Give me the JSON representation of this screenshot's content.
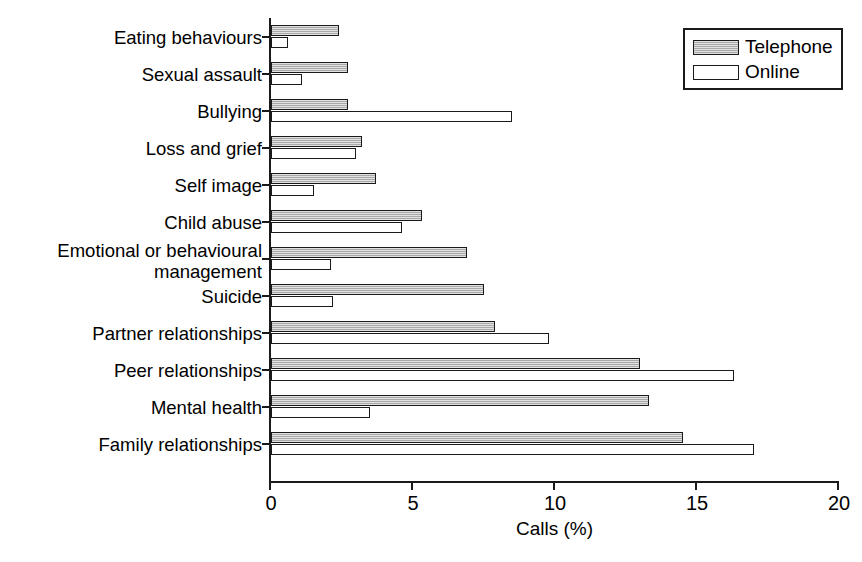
{
  "chart_data": {
    "type": "bar",
    "orientation": "horizontal",
    "title": "",
    "xlabel": "Calls (%)",
    "ylabel": "",
    "xlim": [
      0,
      20
    ],
    "xticks": [
      0,
      5,
      10,
      15,
      20
    ],
    "xtick_labels": [
      "0",
      "5",
      "10",
      "15",
      "20"
    ],
    "grid": false,
    "legend_position": "top-right",
    "categories": [
      "Eating behaviours",
      "Sexual assault",
      "Bullying",
      "Loss and grief",
      "Self image",
      "Child abuse",
      "Emotional or behavioural\nmanagement",
      "Suicide",
      "Partner relationships",
      "Peer relationships",
      "Mental health",
      "Family relationships"
    ],
    "series": [
      {
        "name": "Telephone",
        "color": "#bdbdbd",
        "values": [
          2.4,
          2.7,
          2.7,
          3.2,
          3.7,
          5.3,
          6.9,
          7.5,
          7.9,
          13.0,
          13.3,
          14.5
        ]
      },
      {
        "name": "Online",
        "color": "#ffffff",
        "values": [
          0.6,
          1.1,
          8.5,
          3.0,
          1.5,
          4.6,
          2.1,
          2.2,
          9.8,
          16.3,
          3.5,
          17.0
        ]
      }
    ]
  },
  "legend": {
    "items": [
      {
        "label": "Telephone",
        "swatch": "telephone"
      },
      {
        "label": "Online",
        "swatch": "online"
      }
    ]
  },
  "axis": {
    "x_title": "Calls (%)"
  }
}
